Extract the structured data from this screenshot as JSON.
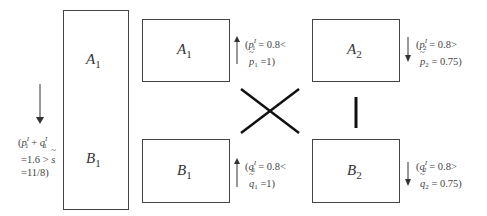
{
  "diagram": {
    "tall_box": {
      "top_label": {
        "letter": "A",
        "sub": "1"
      },
      "bottom_label": {
        "letter": "B",
        "sub": "1"
      },
      "link": "bar"
    },
    "left_note": {
      "arrow": "down",
      "line1_prefix": "(",
      "line1_p": "p",
      "line1_p_sup": "I",
      "line1_p_sub": "1",
      "line1_plus": " + ",
      "line1_q": "q",
      "line1_q_sup": "I",
      "line1_q_sub": "1",
      "line2_text": "=1.6 > ",
      "line2_var": "s",
      "line3_text": "=11/8)"
    },
    "boxes": [
      {
        "id": "A1",
        "letter": "A",
        "sub": "1"
      },
      {
        "id": "B1",
        "letter": "B",
        "sub": "1"
      },
      {
        "id": "A2",
        "letter": "A",
        "sub": "2"
      },
      {
        "id": "B2",
        "letter": "B",
        "sub": "2"
      }
    ],
    "notes": {
      "A1": {
        "arrow": "up",
        "var": "p",
        "sup": "I",
        "sub": "1",
        "eq": " = 0.8<",
        "tvar": "p",
        "tsub": "1",
        "teq": " =1)"
      },
      "A2": {
        "arrow": "down",
        "var": "p",
        "sup": "I",
        "sub": "2",
        "eq": " = 0.8>",
        "tvar": "p",
        "tsub": "2",
        "teq": " = 0.75)"
      },
      "B1": {
        "arrow": "up",
        "var": "q",
        "sup": "I",
        "sub": "1",
        "eq": " = 0.8<",
        "tvar": "q",
        "tsub": "1",
        "teq": " =1)"
      },
      "B2": {
        "arrow": "down",
        "var": "q",
        "sup": "I",
        "sub": "2",
        "eq": " = 0.8>",
        "tvar": "q",
        "tsub": "2",
        "teq": " = 0.75)"
      }
    },
    "links": [
      {
        "from": "A1",
        "to": "B2",
        "type": "cross"
      },
      {
        "from": "B1",
        "to": "A2",
        "type": "cross"
      },
      {
        "from": "A2",
        "to": "B2",
        "type": "bar"
      }
    ],
    "colors": {
      "stroke": "#444444",
      "link": "#111111",
      "background": "#ffffff"
    }
  }
}
